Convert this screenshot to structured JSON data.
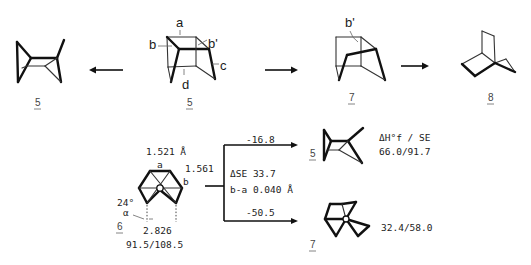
{
  "top_scheme": {
    "compounds": [
      {
        "id": "5",
        "label": "5"
      },
      {
        "id": "6",
        "label": "6",
        "bond_labels": [
          "a",
          "b",
          "b'",
          "c",
          "d"
        ]
      },
      {
        "id": "7",
        "label": "7",
        "bond_labels": [
          "b'"
        ]
      },
      {
        "id": "8",
        "label": "8"
      }
    ],
    "arrows": [
      {
        "from": "6",
        "to": "5",
        "direction": "left"
      },
      {
        "from": "6",
        "to": "7",
        "direction": "right"
      },
      {
        "from": "7",
        "to": "8",
        "direction": "right"
      }
    ]
  },
  "bottom_scheme": {
    "compound_6": {
      "label": "6",
      "bond_a_length": "1.521 Å",
      "bond_b_length": "1.561",
      "label_a": "a",
      "label_b": "b",
      "angle": "24°",
      "alpha": "α",
      "distance": "2.826",
      "hf_se": "91.5/108.5"
    },
    "branch_center": {
      "delta_se": "ΔSE 33.7",
      "b_minus_a": "b-a 0.040 Å"
    },
    "branches": [
      {
        "target": "5",
        "energy": "-16.8",
        "header": "ΔH°f / SE",
        "hf_se": "66.0/91.7"
      },
      {
        "target": "7",
        "energy": "-50.5",
        "hf_se": "32.4/58.0"
      }
    ]
  }
}
